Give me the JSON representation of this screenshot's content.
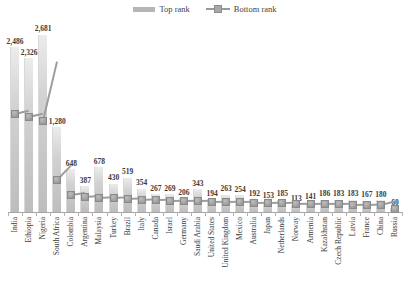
{
  "legend": {
    "position": "top-center",
    "entries": [
      {
        "label": "Top rank",
        "marker": "bar-swatch-icon",
        "color": "#b5b5b5"
      },
      {
        "label": "Bottom rank",
        "marker": "line-square-marker-icon",
        "color": "#9a9a9a"
      }
    ]
  },
  "chart_data": {
    "type": "bar",
    "title": "",
    "subtitle": "",
    "xlabel": "",
    "ylabel": "",
    "grid": false,
    "legend_position": "top-center",
    "ylim": [
      0,
      2900
    ],
    "categories": [
      "India",
      "Ethiopia",
      "Nigeria",
      "South Africa",
      "Colombia",
      "Argentina",
      "Malaysia",
      "Turkey",
      "Brazil",
      "Italy",
      "Canada",
      "Israel",
      "Germany",
      "Saudi Arabia",
      "United States",
      "United Kingdom",
      "Mexico",
      "Australia",
      "Japan",
      "Netherlands",
      "Norway",
      "Armenia",
      "Kazakhstan",
      "Czech Republic",
      "Latvia",
      "France",
      "China",
      "Russia"
    ],
    "series": [
      {
        "name": "Top rank",
        "type": "bar",
        "values": [
          2486,
          2326,
          2681,
          1280,
          648,
          387,
          678,
          430,
          519,
          354,
          267,
          269,
          206,
          343,
          194,
          263,
          254,
          192,
          153,
          185,
          113,
          141,
          186,
          183,
          183,
          167,
          180,
          60
        ],
        "labels": [
          "2,486",
          "2,326",
          "2,681",
          "1,280",
          "648",
          "387",
          "678",
          "430",
          "519",
          "354",
          "267",
          "269",
          "206",
          "343",
          "194",
          "263",
          "254",
          "192",
          "153",
          "185",
          "113",
          "141",
          "186",
          "183",
          "183",
          "167",
          "180",
          "60"
        ]
      },
      {
        "name": "Bottom rank",
        "type": "line",
        "values": [
          1480,
          1430,
          1380,
          480,
          260,
          230,
          215,
          205,
          195,
          185,
          175,
          170,
          165,
          160,
          155,
          150,
          145,
          140,
          135,
          130,
          125,
          120,
          118,
          115,
          112,
          108,
          100,
          45
        ]
      }
    ]
  }
}
